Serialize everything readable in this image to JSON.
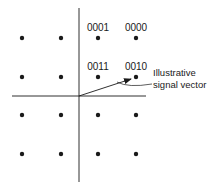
{
  "diagram": {
    "grid": {
      "columns": [
        -2,
        -1,
        1,
        2
      ],
      "rows": [
        2,
        1,
        -1,
        -2
      ]
    },
    "point_labels": [
      {
        "i": 1,
        "q": 2,
        "text": "0001"
      },
      {
        "i": 2,
        "q": 2,
        "text": "0000"
      },
      {
        "i": 1,
        "q": 1,
        "text": "0011"
      },
      {
        "i": 2,
        "q": 1,
        "text": "0010"
      }
    ],
    "vector": {
      "to_i": 2,
      "to_q": 1
    },
    "annotation": {
      "line1": "Illustrative",
      "line2": "signal vector"
    },
    "colors": {
      "ink": "#1a1a1a",
      "background": "#ffffff"
    }
  }
}
